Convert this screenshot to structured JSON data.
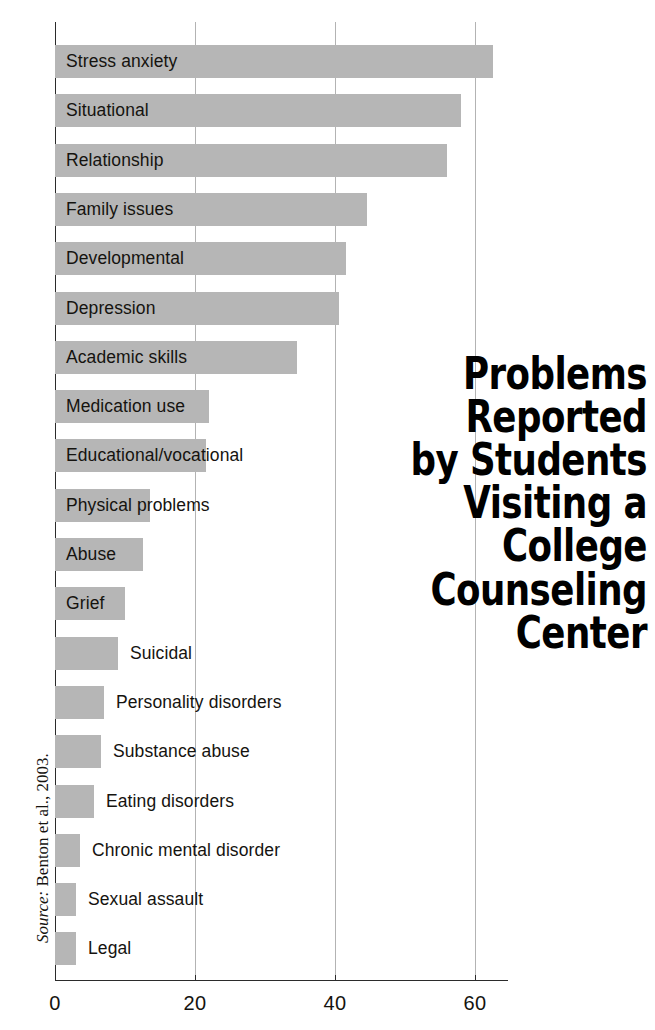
{
  "title": {
    "lines": [
      "Problems",
      "Reported",
      "by Students",
      "Visiting a",
      "College",
      "Counseling",
      "Center"
    ],
    "full": "Problems Reported by Students Visiting a College Counseling Center"
  },
  "source": {
    "label": "Source:",
    "text": " Benton et al., 2003.",
    "full": "Source: Benton et al., 2003."
  },
  "axis": {
    "x_ticks": [
      "0",
      "20",
      "40",
      "60"
    ],
    "x_tick_values": [
      0,
      20,
      40,
      60
    ]
  },
  "colors": {
    "bar": "#b6b6b6",
    "axis": "#2b2b2b",
    "grid": "#9a9a9a",
    "text": "#15130f",
    "title": "#000000",
    "background": "#ffffff"
  },
  "chart_data": {
    "type": "bar",
    "orientation": "horizontal",
    "xlabel": "",
    "ylabel": "",
    "xlim": [
      0,
      65
    ],
    "grid": true,
    "legend": false,
    "source": "Source: Benton et al., 2003.",
    "categories": [
      "Stress anxiety",
      "Situational",
      "Relationship",
      "Family issues",
      "Developmental",
      "Depression",
      "Academic skills",
      "Medication use",
      "Educational/vocational",
      "Physical problems",
      "Abuse",
      "Grief",
      "Suicidal",
      "Personality disorders",
      "Substance abuse",
      "Eating disorders",
      "Chronic mental disorder",
      "Sexual assault",
      "Legal"
    ],
    "values": [
      62.5,
      58,
      56,
      44.5,
      41.5,
      40.5,
      34.5,
      22,
      21.5,
      13.5,
      12.5,
      10,
      9,
      7,
      6.5,
      5.5,
      3.5,
      3,
      3
    ],
    "xticks": [
      0,
      20,
      40,
      60
    ]
  },
  "bars": [
    {
      "label": "Stress anxiety",
      "value": 62.5,
      "label_inside": true
    },
    {
      "label": "Situational",
      "value": 58,
      "label_inside": true
    },
    {
      "label": "Relationship",
      "value": 56,
      "label_inside": true
    },
    {
      "label": "Family issues",
      "value": 44.5,
      "label_inside": true
    },
    {
      "label": "Developmental",
      "value": 41.5,
      "label_inside": true
    },
    {
      "label": "Depression",
      "value": 40.5,
      "label_inside": true
    },
    {
      "label": "Academic skills",
      "value": 34.5,
      "label_inside": true
    },
    {
      "label": "Medication use",
      "value": 22,
      "label_inside": true
    },
    {
      "label": "Educational/vocational",
      "value": 21.5,
      "label_inside": true
    },
    {
      "label": "Physical problems",
      "value": 13.5,
      "label_inside": true
    },
    {
      "label": "Abuse",
      "value": 12.5,
      "label_inside": true
    },
    {
      "label": "Grief",
      "value": 10,
      "label_inside": true
    },
    {
      "label": "Suicidal",
      "value": 9,
      "label_inside": false
    },
    {
      "label": "Personality disorders",
      "value": 7,
      "label_inside": false
    },
    {
      "label": "Substance abuse",
      "value": 6.5,
      "label_inside": false
    },
    {
      "label": "Eating disorders",
      "value": 5.5,
      "label_inside": false
    },
    {
      "label": "Chronic mental disorder",
      "value": 3.5,
      "label_inside": false
    },
    {
      "label": "Sexual assault",
      "value": 3,
      "label_inside": false
    },
    {
      "label": "Legal",
      "value": 3,
      "label_inside": false
    }
  ]
}
